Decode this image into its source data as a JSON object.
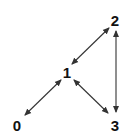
{
  "diagram": {
    "type": "directed-graph",
    "nodes": [
      {
        "id": "0",
        "label": "0"
      },
      {
        "id": "1",
        "label": "1"
      },
      {
        "id": "2",
        "label": "2"
      },
      {
        "id": "3",
        "label": "3"
      }
    ],
    "edges": [
      {
        "from": "1",
        "to": "2",
        "direction": "bidirectional"
      },
      {
        "from": "2",
        "to": "3",
        "direction": "bidirectional"
      },
      {
        "from": "1",
        "to": "0",
        "direction": "bidirectional"
      },
      {
        "from": "1",
        "to": "3",
        "direction": "bidirectional"
      }
    ],
    "colors": {
      "edge": "#333333",
      "label": "#111111",
      "background": "#ffffff"
    }
  }
}
